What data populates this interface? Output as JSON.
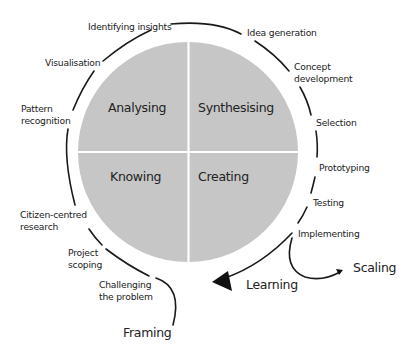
{
  "diagram": {
    "colors": {
      "circle_fill": "#c6c6c6",
      "divider": "#ffffff",
      "arc_stroke": "#1a1a1a",
      "text": "#222222",
      "background": "#ffffff"
    },
    "quadrants": {
      "top_left": "Analysing",
      "top_right": "Synthesising",
      "bottom_left": "Knowing",
      "bottom_right": "Creating"
    },
    "stages": {
      "identifying_insights": "Identifying insights",
      "idea_generation": "Idea generation",
      "concept_development_1": "Concept",
      "concept_development_2": "development",
      "selection": "Selection",
      "prototyping": "Prototyping",
      "testing": "Testing",
      "implementing": "Implementing",
      "visualisation": "Visualisation",
      "pattern_recognition_1": "Pattern",
      "pattern_recognition_2": "recognition",
      "citizen_centred_research_1": "Citizen-centred",
      "citizen_centred_research_2": "research",
      "project_scoping_1": "Project",
      "project_scoping_2": "scoping",
      "challenging_the_problem_1": "Challenging",
      "challenging_the_problem_2": "the problem"
    },
    "outcomes": {
      "scaling": "Scaling",
      "learning": "Learning",
      "framing": "Framing"
    }
  }
}
